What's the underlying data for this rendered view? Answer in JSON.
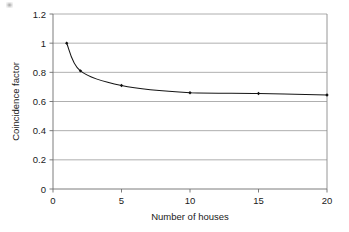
{
  "chart_data": {
    "type": "line",
    "title": "",
    "subtitle": "",
    "xlabel": "Number of houses",
    "ylabel": "Coincidence factor",
    "xlim": [
      0,
      20
    ],
    "ylim": [
      0,
      1.2
    ],
    "grid": "horizontal",
    "legend": "none",
    "x_ticks": [
      0,
      5,
      10,
      15,
      20
    ],
    "x_tick_labels": [
      "0",
      "5",
      "10",
      "15",
      "20"
    ],
    "y_ticks": [
      0,
      0.2,
      0.4,
      0.6,
      0.8,
      1,
      1.2
    ],
    "y_tick_labels": [
      "0",
      "0.2",
      "0.4",
      "0.6",
      "0.8",
      "1",
      "1.2"
    ],
    "series": [
      {
        "name": "Coincidence factor",
        "marker": "diamond",
        "color": "#101010",
        "x": [
          1,
          2,
          5,
          10,
          15,
          20
        ],
        "values": [
          1.0,
          0.81,
          0.71,
          0.66,
          0.655,
          0.645
        ]
      }
    ]
  },
  "figure": {
    "background_color": "#ffffff",
    "grid_color": "#9a9a9a",
    "axis_color": "#6e6e6e",
    "curve_color": "#151515",
    "text_color": "#1a1a1a"
  }
}
